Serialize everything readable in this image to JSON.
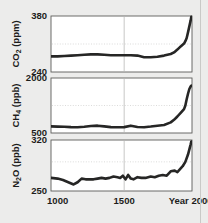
{
  "figure": {
    "background_color": "#ececeb",
    "series_color": "#262625",
    "panel_background": "#ffffff",
    "xaxis": {
      "ticks": [
        {
          "value": 1000,
          "label": "1000"
        },
        {
          "value": 1500,
          "label": "1500"
        },
        {
          "value": 2000,
          "label": "Year 2000"
        }
      ],
      "range": [
        950,
        2010
      ]
    },
    "panels": [
      {
        "id": "co2",
        "ylabel": "CO",
        "ylabel_sub": "2",
        "ylabel_unit": " (ppm)",
        "yticks": [
          {
            "value": 380,
            "label": "380"
          },
          {
            "value": 240,
            "label": "240"
          }
        ],
        "ylim": [
          240,
          380
        ],
        "gridline_h": 310
      },
      {
        "id": "ch4",
        "ylabel": "CH",
        "ylabel_sub": "4",
        "ylabel_unit": " (ppb)",
        "yticks": [
          {
            "value": 2000,
            "label": "2000"
          },
          {
            "value": 500,
            "label": "500"
          }
        ],
        "ylim": [
          500,
          2000
        ],
        "gridline_h": 1250
      },
      {
        "id": "n2o",
        "ylabel": "N",
        "ylabel_sub": "2",
        "ylabel_unit": "O (ppb)",
        "yticks": [
          {
            "value": 320,
            "label": "320"
          },
          {
            "value": 250,
            "label": "250"
          }
        ],
        "ylim": [
          250,
          320
        ],
        "gridline_h": 290
      }
    ]
  },
  "chart_data": [
    {
      "type": "line",
      "id": "co2",
      "title": "",
      "xlabel": "Year",
      "ylabel": "CO2 (ppm)",
      "xlim": [
        950,
        2010
      ],
      "ylim": [
        240,
        380
      ],
      "grid": true,
      "legend": "none",
      "x": [
        950,
        1000,
        1050,
        1100,
        1150,
        1200,
        1250,
        1300,
        1350,
        1400,
        1450,
        1500,
        1550,
        1600,
        1650,
        1700,
        1750,
        1800,
        1850,
        1875,
        1900,
        1925,
        1950,
        1960,
        1970,
        1980,
        1990,
        2000,
        2005
      ],
      "values": [
        279,
        279,
        280,
        281,
        282,
        283,
        284,
        284,
        283,
        282,
        282,
        282,
        282,
        281,
        277,
        277,
        278,
        281,
        285,
        289,
        296,
        304,
        311,
        317,
        325,
        339,
        354,
        369,
        378
      ]
    },
    {
      "type": "line",
      "id": "ch4",
      "title": "",
      "xlabel": "Year",
      "ylabel": "CH4 (ppb)",
      "xlim": [
        950,
        2010
      ],
      "ylim": [
        500,
        2000
      ],
      "grid": true,
      "legend": "none",
      "x": [
        950,
        1000,
        1050,
        1100,
        1150,
        1200,
        1250,
        1300,
        1350,
        1400,
        1450,
        1500,
        1550,
        1600,
        1650,
        1700,
        1750,
        1800,
        1850,
        1875,
        1900,
        1925,
        1950,
        1960,
        1970,
        1980,
        1990,
        2000,
        2005
      ],
      "values": [
        680,
        675,
        670,
        660,
        655,
        670,
        690,
        700,
        680,
        660,
        655,
        660,
        700,
        665,
        655,
        675,
        700,
        720,
        790,
        860,
        950,
        1050,
        1150,
        1250,
        1420,
        1570,
        1700,
        1770,
        1790
      ]
    },
    {
      "type": "line",
      "id": "n2o",
      "title": "",
      "xlabel": "Year",
      "ylabel": "N2O (ppb)",
      "xlim": [
        950,
        2010
      ],
      "ylim": [
        250,
        320
      ],
      "grid": true,
      "legend": "none",
      "x": [
        950,
        1000,
        1040,
        1080,
        1120,
        1150,
        1180,
        1210,
        1240,
        1270,
        1300,
        1330,
        1360,
        1390,
        1420,
        1450,
        1470,
        1490,
        1510,
        1530,
        1550,
        1570,
        1600,
        1630,
        1660,
        1700,
        1730,
        1760,
        1790,
        1820,
        1850,
        1880,
        1900,
        1920,
        1940,
        1960,
        1980,
        2000,
        2005
      ],
      "values": [
        268,
        267,
        265,
        262,
        259,
        262,
        267,
        266,
        266,
        266,
        267,
        268,
        267,
        268,
        270,
        269,
        268,
        271,
        266,
        272,
        267,
        266,
        269,
        268,
        268,
        270,
        269,
        271,
        272,
        271,
        277,
        278,
        276,
        280,
        284,
        290,
        300,
        314,
        318
      ]
    }
  ]
}
